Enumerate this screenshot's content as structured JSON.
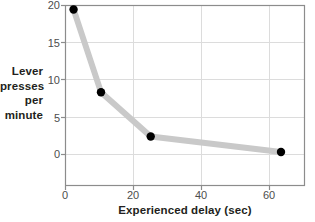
{
  "chart_data": {
    "type": "line",
    "title": "",
    "xlabel": "Experienced delay (sec)",
    "ylabel": "Lever presses per minute",
    "ylabel_lines": [
      "Lever",
      "presses",
      "per",
      "minute"
    ],
    "x": [
      2.5,
      10.5,
      25,
      63
    ],
    "values": [
      19.4,
      8.2,
      2.2,
      0.1
    ],
    "series": [
      {
        "name": "Lever presses per minute",
        "x": [
          2.5,
          10.5,
          25,
          63
        ],
        "values": [
          19.4,
          8.2,
          2.2,
          0.1
        ]
      }
    ],
    "xlim": [
      0,
      70
    ],
    "ylim": [
      -4.5,
      20
    ],
    "xticks": [
      0,
      20,
      40,
      60
    ],
    "xtick_labels": [
      "0",
      "20",
      "40",
      "60"
    ],
    "yticks": [
      0,
      5,
      10,
      15,
      20
    ],
    "ytick_labels": [
      "0",
      "5",
      "10",
      "15",
      "20"
    ],
    "grid": "horizontal-and-vertical",
    "legend": "none",
    "colors": {
      "line": "#c9c9c9",
      "marker": "#000000",
      "grid": "#d9d9d9",
      "frame": "#808080",
      "tick_text": "#4d4d4d",
      "axis_title_text": "#231f20",
      "background": "#ffffff"
    }
  },
  "axis": {
    "y_title_lines": [
      "Lever",
      "presses",
      "per",
      "minute"
    ],
    "y_ticks": [
      "20",
      "15",
      "10",
      "5",
      "0"
    ],
    "x_ticks": [
      "0",
      "20",
      "40",
      "60"
    ],
    "x_title": "Experienced delay (sec)"
  }
}
